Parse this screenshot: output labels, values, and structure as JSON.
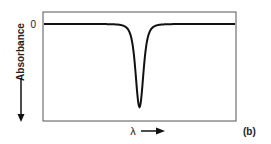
{
  "chart_data": {
    "type": "line",
    "title": "",
    "panel_label": "(b)",
    "xlabel": "λ",
    "ylabel": "Absorbance",
    "y_tick_labels": [
      "0"
    ],
    "x_direction": "increasing-right",
    "y_direction": "increasing-down",
    "grid": false,
    "series": [
      {
        "name": "absorbance",
        "x": [
          0,
          0.2,
          0.4,
          0.45,
          0.48,
          0.5,
          0.52,
          0.55,
          0.6,
          0.8,
          1.0
        ],
        "y": [
          0,
          0,
          0,
          -0.03,
          -0.3,
          -1.0,
          -0.3,
          -0.03,
          0,
          0,
          0
        ]
      }
    ],
    "xlim": [
      0,
      1
    ],
    "ylim": [
      -1.2,
      0.15
    ]
  }
}
